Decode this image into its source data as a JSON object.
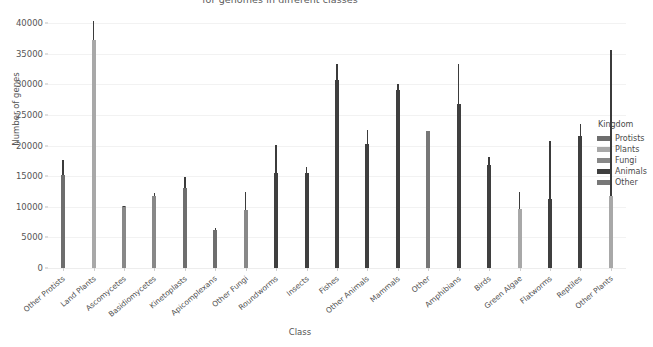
{
  "chart_data": {
    "type": "bar",
    "title": "for genomes in different classes",
    "xlabel": "Class",
    "ylabel": "Number of genes",
    "ylim": [
      0,
      41500
    ],
    "yticks": [
      0,
      5000,
      10000,
      15000,
      20000,
      25000,
      30000,
      35000,
      40000
    ],
    "grid": true,
    "legend": {
      "title": "Kingdom",
      "position": "right",
      "entries": [
        {
          "label": "Protists",
          "color": "#6e6e6e"
        },
        {
          "label": "Plants",
          "color": "#a8a8a8"
        },
        {
          "label": "Fungi",
          "color": "#888888"
        },
        {
          "label": "Animals",
          "color": "#3f3f3f"
        },
        {
          "label": "Other",
          "color": "#777777"
        }
      ]
    },
    "categories": [
      "Other Protists",
      "Land Plants",
      "Ascomycetes",
      "Basidiomycetes",
      "Kinetoplasts",
      "Apicomplexans",
      "Other Fungi",
      "Roundworms",
      "Insects",
      "Fishes",
      "Other Animals",
      "Mammals",
      "Other",
      "Amphibians",
      "Birds",
      "Green Algae",
      "Flatworms",
      "Reptiles",
      "Other Plants"
    ],
    "series": [
      {
        "name": "Number of genes",
        "kingdoms": [
          "Protists",
          "Plants",
          "Fungi",
          "Fungi",
          "Protists",
          "Protists",
          "Fungi",
          "Animals",
          "Animals",
          "Animals",
          "Animals",
          "Animals",
          "Other",
          "Animals",
          "Animals",
          "Plants",
          "Animals",
          "Animals",
          "Plants"
        ],
        "values": [
          15200,
          37200,
          10100,
          11800,
          13100,
          6200,
          9400,
          15600,
          15500,
          30700,
          20200,
          29100,
          22400,
          26800,
          16900,
          9600,
          11200,
          21600,
          11800
        ],
        "err_high": [
          17700,
          40300,
          10200,
          12300,
          14900,
          6600,
          12400,
          20100,
          16500,
          33400,
          22500,
          30000,
          17900,
          33300,
          18200,
          12400,
          20700,
          23500,
          35600
        ]
      }
    ]
  }
}
